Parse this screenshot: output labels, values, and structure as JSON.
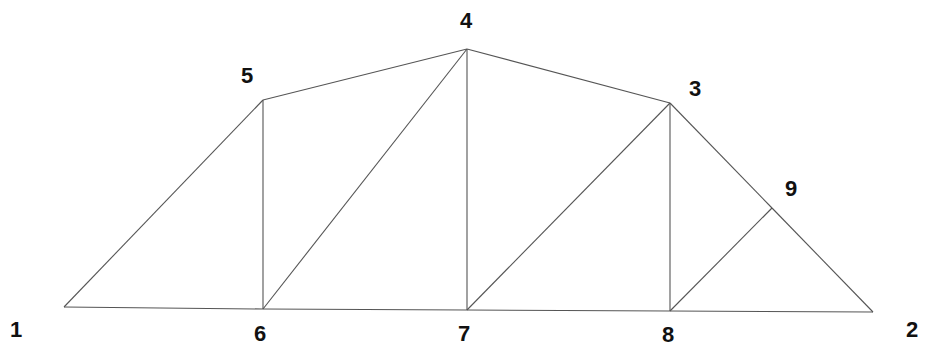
{
  "diagram": {
    "title": "",
    "type": "truss",
    "nodes": [
      {
        "id": "1",
        "x": 64,
        "y": 307,
        "label": "1",
        "lx": 10,
        "ly": 337
      },
      {
        "id": "2",
        "x": 873,
        "y": 312,
        "label": "2",
        "lx": 906,
        "ly": 337
      },
      {
        "id": "3",
        "x": 670,
        "y": 103,
        "label": "3",
        "lx": 689,
        "ly": 96
      },
      {
        "id": "4",
        "x": 467,
        "y": 49,
        "label": "4",
        "lx": 460,
        "ly": 28
      },
      {
        "id": "5",
        "x": 263,
        "y": 100,
        "label": "5",
        "lx": 241,
        "ly": 83
      },
      {
        "id": "6",
        "x": 263,
        "y": 309,
        "label": "6",
        "lx": 254,
        "ly": 341
      },
      {
        "id": "7",
        "x": 467,
        "y": 310,
        "label": "7",
        "lx": 458,
        "ly": 341
      },
      {
        "id": "8",
        "x": 670,
        "y": 311,
        "label": "8",
        "lx": 662,
        "ly": 342
      },
      {
        "id": "9",
        "x": 772,
        "y": 208,
        "label": "9",
        "lx": 785,
        "ly": 196
      }
    ],
    "members": [
      [
        "1",
        "6"
      ],
      [
        "6",
        "7"
      ],
      [
        "7",
        "8"
      ],
      [
        "8",
        "2"
      ],
      [
        "1",
        "5"
      ],
      [
        "5",
        "4"
      ],
      [
        "4",
        "3"
      ],
      [
        "3",
        "9"
      ],
      [
        "9",
        "2"
      ],
      [
        "5",
        "6"
      ],
      [
        "6",
        "4"
      ],
      [
        "4",
        "7"
      ],
      [
        "7",
        "3"
      ],
      [
        "3",
        "8"
      ],
      [
        "8",
        "9"
      ]
    ],
    "colors": {
      "line": "#555555",
      "label": "#111111",
      "background": "#ffffff"
    }
  }
}
